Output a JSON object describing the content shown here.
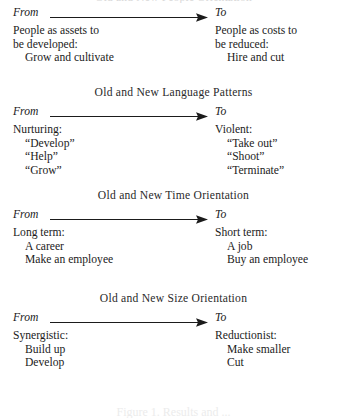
{
  "page": {
    "top_clipped_heading": "Old and New People Orientation",
    "caption": "Figure 1.  Results and ..."
  },
  "arrow_row": {
    "from_label": "From",
    "to_label": "To",
    "arrow_icon": "right-arrow-icon"
  },
  "blocks": [
    {
      "heading": "",
      "left": {
        "lead": [
          "People as assets to",
          "be developed:"
        ],
        "items": [
          "Grow and cultivate"
        ]
      },
      "right": {
        "lead": [
          "People as costs to",
          "be reduced:"
        ],
        "items": [
          "Hire and cut"
        ]
      }
    },
    {
      "heading": "Old and New Language Patterns",
      "left": {
        "lead": [
          "Nurturing:"
        ],
        "items": [
          "“Develop”",
          "“Help”",
          "“Grow”"
        ]
      },
      "right": {
        "lead": [
          "Violent:"
        ],
        "items": [
          "“Take out”",
          "“Shoot”",
          "“Terminate”"
        ]
      }
    },
    {
      "heading": "Old and New Time Orientation",
      "left": {
        "lead": [
          "Long term:"
        ],
        "items": [
          "A career",
          "Make an employee"
        ]
      },
      "right": {
        "lead": [
          "Short term:"
        ],
        "items": [
          "A job",
          "Buy an employee"
        ]
      }
    },
    {
      "heading": "Old and New Size Orientation",
      "left": {
        "lead": [
          "Synergistic:"
        ],
        "items": [
          "Build up",
          "Develop"
        ]
      },
      "right": {
        "lead": [
          "Reductionist:"
        ],
        "items": [
          "Make smaller",
          "Cut"
        ]
      }
    }
  ]
}
